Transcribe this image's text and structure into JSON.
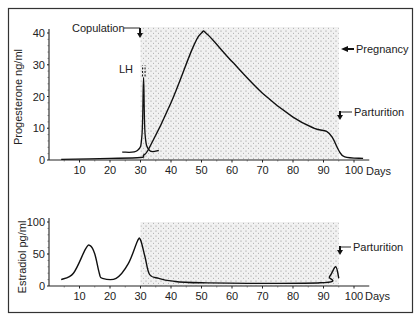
{
  "chart_data": [
    {
      "type": "line",
      "title": "",
      "xlabel": "Days",
      "ylabel": "Progesterone ng/ml",
      "xlim": [
        0,
        105
      ],
      "ylim": [
        0,
        40
      ],
      "xticks": [
        10,
        20,
        30,
        40,
        50,
        60,
        70,
        80,
        90,
        100
      ],
      "yticks": [
        0,
        10,
        20,
        30,
        40
      ],
      "shaded_region": {
        "x": [
          30,
          95
        ],
        "label": "Pregnancy"
      },
      "series": [
        {
          "name": "Progesterone",
          "x": [
            4,
            20,
            30,
            31,
            33,
            40,
            47,
            50,
            52,
            60,
            70,
            80,
            87,
            91,
            93,
            95,
            97,
            103
          ],
          "values": [
            0.2,
            0.5,
            0.8,
            1.5,
            4,
            18,
            35,
            40,
            39.5,
            31,
            21,
            13.5,
            10,
            9,
            7,
            3,
            1,
            0.5
          ]
        },
        {
          "name": "LH",
          "x": [
            24,
            29,
            30.5,
            31,
            31.5,
            33,
            36
          ],
          "values": [
            2.5,
            3,
            8,
            26,
            8,
            3,
            3
          ]
        }
      ],
      "annotations": [
        {
          "text": "Copulation",
          "x": 30
        },
        {
          "text": "LH",
          "x": 30
        },
        {
          "text": "Pregnancy",
          "x": 95
        },
        {
          "text": "Parturition",
          "x": 95
        }
      ]
    },
    {
      "type": "line",
      "title": "",
      "xlabel": "Days",
      "ylabel": "Estradiol pg/ml",
      "xlim": [
        0,
        105
      ],
      "ylim": [
        0,
        100
      ],
      "xticks": [
        10,
        20,
        30,
        40,
        50,
        60,
        70,
        80,
        90,
        100
      ],
      "yticks": [
        0,
        50,
        100
      ],
      "shaded_region": {
        "x": [
          30,
          95
        ]
      },
      "series": [
        {
          "name": "Estradiol",
          "x": [
            4,
            8,
            12,
            13.5,
            15,
            16.5,
            17.5,
            22,
            26,
            29,
            30,
            31.5,
            33,
            36,
            40,
            50,
            89,
            92,
            94,
            95
          ],
          "values": [
            10,
            20,
            58,
            63,
            50,
            20,
            12,
            12,
            35,
            70,
            72,
            45,
            18,
            12,
            8,
            5,
            5,
            15,
            30,
            12
          ]
        }
      ],
      "annotations": [
        {
          "text": "Parturition",
          "x": 95
        }
      ]
    }
  ],
  "labels": {
    "top_ylabel": "Progesterone ng/ml",
    "bottom_ylabel": "Estradiol pg/ml",
    "xunit": "Days",
    "copulation": "Copulation",
    "lh": "LH",
    "pregnancy": "Pregnancy",
    "parturition_top": "Parturition",
    "parturition_bottom": "Parturition"
  }
}
